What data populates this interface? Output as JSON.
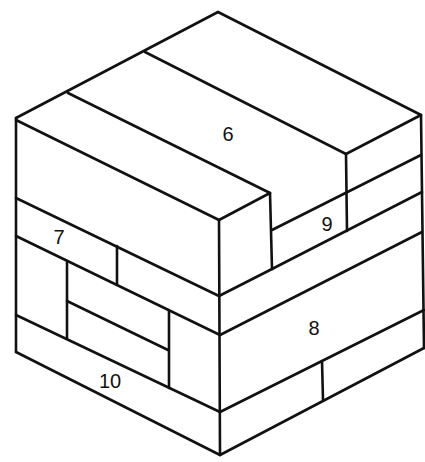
{
  "diagram": {
    "type": "isometric-block-cube",
    "colors": {
      "line": "#111111",
      "background": "#ffffff"
    },
    "labels": [
      {
        "id": "block-6",
        "text": "6",
        "x": 228,
        "y": 134
      },
      {
        "id": "block-7",
        "text": "7",
        "x": 59,
        "y": 237
      },
      {
        "id": "block-8",
        "text": "8",
        "x": 314,
        "y": 328
      },
      {
        "id": "block-9",
        "text": "9",
        "x": 327,
        "y": 224
      },
      {
        "id": "block-10",
        "text": "10",
        "x": 110,
        "y": 381
      }
    ]
  }
}
